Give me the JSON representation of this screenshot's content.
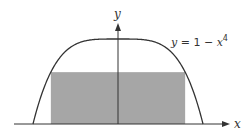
{
  "figure": {
    "type": "function-graph-with-inscribed-rectangle",
    "function_label_var": "y",
    "function_label_rest": " = 1 − ",
    "function_label_x": "x",
    "function_label_exp": "4",
    "x_axis_label": "x",
    "y_axis_label": "y",
    "colors": {
      "curve": "#333333",
      "axes": "#333333",
      "rectangle_fill": "#a6a6a6",
      "background": "#ffffff"
    },
    "rectangle": {
      "x_half_width": 0.79,
      "height": 0.61
    },
    "domain": [
      -1,
      1
    ]
  }
}
